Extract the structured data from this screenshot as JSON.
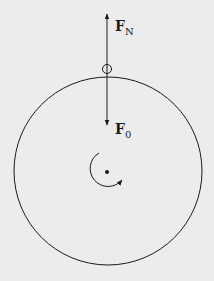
{
  "diagram": {
    "type": "free-body diagram of rotating wheel",
    "forces": [
      {
        "symbol": "F",
        "subscript": "N",
        "direction": "up"
      },
      {
        "symbol": "F",
        "subscript": "0",
        "direction": "down"
      }
    ],
    "elements": [
      "large circle (wheel)",
      "small circle (contact point at top)",
      "center dot (axle)",
      "clockwise rotation arrow"
    ],
    "colors": {
      "background": "#ececec",
      "ink": "#1a1a1a"
    }
  }
}
